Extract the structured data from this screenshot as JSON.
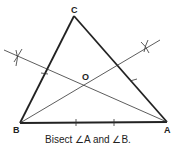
{
  "diagram": {
    "type": "geometric-construction",
    "vertices": {
      "A": {
        "label": "A",
        "x": 167,
        "y": 122
      },
      "B": {
        "label": "B",
        "x": 20,
        "y": 123
      },
      "C": {
        "label": "C",
        "x": 74,
        "y": 16
      }
    },
    "incenter": {
      "label": "O",
      "x": 85,
      "y": 84
    },
    "caption": "Bisect ∠A and ∠B.",
    "colors": {
      "stroke": "#222222",
      "background": "#ffffff"
    }
  }
}
